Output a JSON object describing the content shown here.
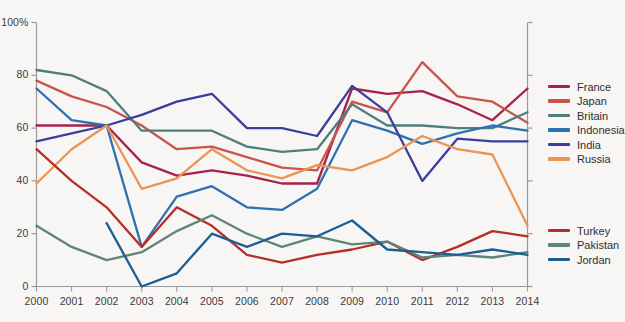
{
  "axes": {
    "y_label_top": "100%",
    "y_ticks": [
      "100%",
      "80",
      "60",
      "40",
      "20",
      "0"
    ],
    "y_tick_values": [
      100,
      80,
      60,
      40,
      20,
      0
    ],
    "x_ticks": [
      "2000",
      "2001",
      "2002",
      "2003",
      "2004",
      "2005",
      "2006",
      "2007",
      "2008",
      "2009",
      "2010",
      "2011",
      "2012",
      "2013",
      "2014"
    ]
  },
  "legend": {
    "group_one": [
      {
        "label": "France",
        "color": "#a8224b"
      },
      {
        "label": "Japan",
        "color": "#c9544f"
      },
      {
        "label": "Britain",
        "color": "#4f7f7d"
      },
      {
        "label": "Indonesia",
        "color": "#2e71b0"
      },
      {
        "label": "India",
        "color": "#3a3f9e"
      },
      {
        "label": "Russia",
        "color": "#ec9452"
      }
    ],
    "group_two": [
      {
        "label": "Turkey",
        "color": "#b52f2a"
      },
      {
        "label": "Pakistan",
        "color": "#5f8577"
      },
      {
        "label": "Jordan",
        "color": "#1b5e96"
      }
    ]
  },
  "chart_data": {
    "type": "line",
    "title": "",
    "xlabel": "",
    "ylabel": "",
    "xlim": [
      2000,
      2014
    ],
    "ylim": [
      0,
      100
    ],
    "grid": false,
    "legend_position": "right",
    "x": [
      2000,
      2001,
      2002,
      2003,
      2004,
      2005,
      2006,
      2007,
      2008,
      2009,
      2010,
      2011,
      2012,
      2013,
      2014
    ],
    "series": [
      {
        "name": "France",
        "color": "#a8224b",
        "values": [
          61,
          61,
          61,
          47,
          42,
          44,
          42,
          39,
          39,
          75,
          73,
          74,
          69,
          63,
          75
        ]
      },
      {
        "name": "Japan",
        "color": "#c9544f",
        "values": [
          78,
          72,
          68,
          61,
          52,
          53,
          49,
          45,
          44,
          70,
          66,
          85,
          72,
          70,
          62
        ]
      },
      {
        "name": "Britain",
        "color": "#4f7f7d",
        "values": [
          82,
          80,
          74,
          59,
          59,
          59,
          53,
          51,
          52,
          69,
          61,
          61,
          60,
          60,
          66
        ]
      },
      {
        "name": "Indonesia",
        "color": "#2e71b0",
        "values": [
          75,
          63,
          61,
          15,
          34,
          38,
          30,
          29,
          37,
          63,
          59,
          54,
          58,
          61,
          59
        ]
      },
      {
        "name": "India",
        "color": "#3a3f9e",
        "values": [
          55,
          58,
          61,
          65,
          70,
          73,
          60,
          60,
          57,
          76,
          66,
          40,
          56,
          55,
          55
        ]
      },
      {
        "name": "Russia",
        "color": "#ec9452",
        "values": [
          39,
          52,
          61,
          37,
          41,
          52,
          44,
          41,
          46,
          44,
          49,
          57,
          52,
          50,
          23
        ]
      },
      {
        "name": "Turkey",
        "color": "#b52f2a",
        "values": [
          52,
          40,
          30,
          15,
          30,
          23,
          12,
          9,
          12,
          14,
          17,
          10,
          15,
          21,
          19
        ]
      },
      {
        "name": "Pakistan",
        "color": "#5f8577",
        "values": [
          23,
          15,
          10,
          13,
          21,
          27,
          20,
          15,
          19,
          16,
          17,
          11,
          12,
          11,
          13
        ]
      },
      {
        "name": "Jordan",
        "color": "#1b5e96",
        "values": [
          null,
          null,
          24,
          0,
          5,
          20,
          15,
          20,
          19,
          25,
          14,
          13,
          12,
          14,
          12
        ]
      }
    ]
  }
}
